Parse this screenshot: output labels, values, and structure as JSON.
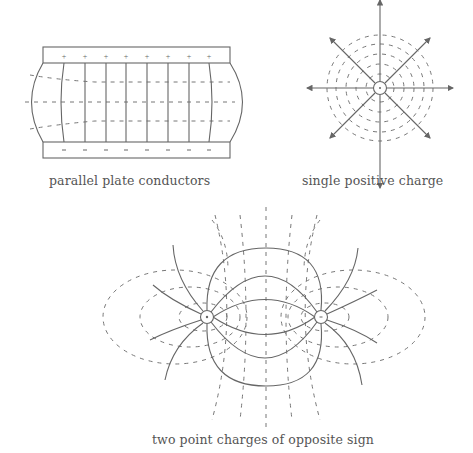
{
  "figures": {
    "parallel_plates": {
      "caption": "parallel plate conductors",
      "top_plate_sign": "+",
      "bottom_plate_sign": "-",
      "field_lines": 9,
      "equipotentials": 3
    },
    "single_charge": {
      "caption": "single positive charge",
      "charge_sign": "+",
      "radial_field_lines": 8,
      "equipotential_circles": 5
    },
    "dipole": {
      "caption": "two point charges of opposite sign",
      "left_charge_sign": "+",
      "right_charge_sign": "-"
    }
  },
  "legend": {
    "solid_line": "field line",
    "dashed_line": "equipotential"
  },
  "colors": {
    "line": "#666666",
    "text": "#555555",
    "background": "#ffffff"
  }
}
